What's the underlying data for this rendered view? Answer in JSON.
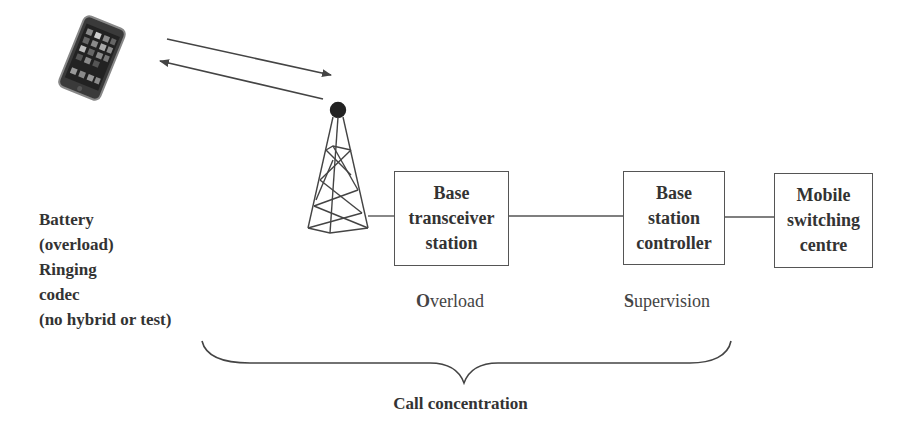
{
  "nodes": [
    {
      "id": "bts",
      "lines": [
        "Base",
        "transceiver",
        "station"
      ]
    },
    {
      "id": "bsc",
      "lines": [
        "Base",
        "station",
        "controller"
      ]
    },
    {
      "id": "msc",
      "lines": [
        "Mobile",
        "switching",
        "centre"
      ]
    }
  ],
  "function_labels": {
    "bts": {
      "initial": "O",
      "rest": "verload"
    },
    "bsc": {
      "initial": "S",
      "rest": "upervision"
    }
  },
  "handset_functions": [
    "Battery",
    "(overload)",
    "Ringing",
    "codec",
    "(no hybrid or test)"
  ],
  "brace_label": "Call concentration",
  "icons": {
    "handset": "smartphone-icon",
    "tower": "cell-tower-icon",
    "uplink": "arrow-right-icon",
    "downlink": "arrow-left-icon"
  },
  "colors": {
    "stroke": "#444444",
    "text": "#333333",
    "background": "#ffffff"
  }
}
